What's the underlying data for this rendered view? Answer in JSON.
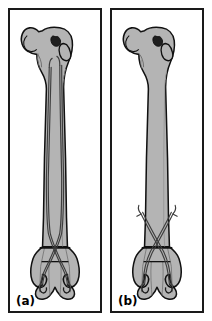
{
  "figure": {
    "caption_a": "(a)",
    "caption_b": "(b)",
    "background_color": "#ffffff",
    "border_color": "#1a1a1a",
    "bone_fill_color": "#b4b4b4",
    "bone_outline_color": "#111111",
    "implant_line_color": "#4a4a4a",
    "shading_color": "#9a9a9a"
  },
  "panels": [
    {
      "id": "panel-a",
      "label": "(a)",
      "subject": "femur",
      "view": "anterior",
      "implant": "two long intramedullary elastic nails spanning full diaphysis",
      "implant_count": 2,
      "fracture_level": "supracondylar transverse line",
      "anatomy": [
        "femoral head",
        "fovea capitis",
        "femoral neck",
        "greater trochanter",
        "lesser trochanter",
        "diaphysis",
        "medial condyle",
        "lateral condyle",
        "intercondylar notch"
      ]
    },
    {
      "id": "panel-b",
      "label": "(b)",
      "subject": "femur",
      "view": "anterior",
      "implant": "two short crossed pins in supracondylar region",
      "implant_count": 2,
      "fracture_level": "supracondylar transverse line",
      "anatomy": [
        "femoral head",
        "fovea capitis",
        "femoral neck",
        "greater trochanter",
        "lesser trochanter",
        "diaphysis",
        "medial condyle",
        "lateral condyle",
        "intercondylar notch"
      ]
    }
  ]
}
